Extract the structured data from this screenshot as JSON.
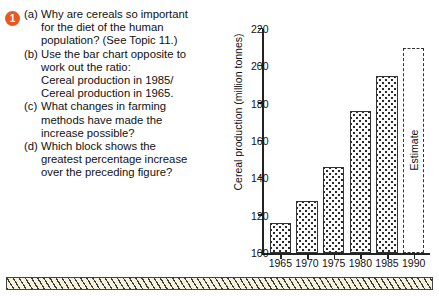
{
  "question": {
    "number": "1",
    "items": [
      {
        "marker": "(a)",
        "lines": [
          "Why are cereals so important",
          "for the diet of the human",
          "population? (See Topic 11.)"
        ]
      },
      {
        "marker": "(b)",
        "lines": [
          "Use the bar chart opposite to",
          "work out the ratio:",
          "Cereal production in 1985/",
          "Cereal production in 1965."
        ]
      },
      {
        "marker": "(c)",
        "lines": [
          "What changes in farming",
          "methods have made the",
          "increase possible?"
        ]
      },
      {
        "marker": "(d)",
        "lines": [
          "Which block shows the",
          "greatest percentage increase",
          "over the preceding figure?"
        ]
      }
    ]
  },
  "chart_data": {
    "type": "bar",
    "title": "",
    "xlabel": "",
    "ylabel": "Cereal production (million tonnes)",
    "categories": [
      "1965",
      "1970",
      "1975",
      "1980",
      "1985",
      "1990"
    ],
    "values": [
      116,
      128,
      146,
      176,
      195,
      210
    ],
    "ylim": [
      100,
      220
    ],
    "yticks": [
      100,
      120,
      140,
      160,
      180,
      200,
      220
    ],
    "grid": false,
    "legend": null,
    "annotations": [
      {
        "label": "Estimate",
        "category": "1990"
      }
    ],
    "series_styles": [
      {
        "category": "1965",
        "style": "stippled"
      },
      {
        "category": "1970",
        "style": "stippled"
      },
      {
        "category": "1975",
        "style": "stippled"
      },
      {
        "category": "1980",
        "style": "stippled"
      },
      {
        "category": "1985",
        "style": "stippled"
      },
      {
        "category": "1990",
        "style": "dashed-outline"
      }
    ]
  },
  "colors": {
    "bullet": "#e8581f",
    "axis": "#222222",
    "bar_outline": "#333333",
    "strip_background": "#f7f2dc",
    "strip_hatch": "#3a3a3a"
  }
}
